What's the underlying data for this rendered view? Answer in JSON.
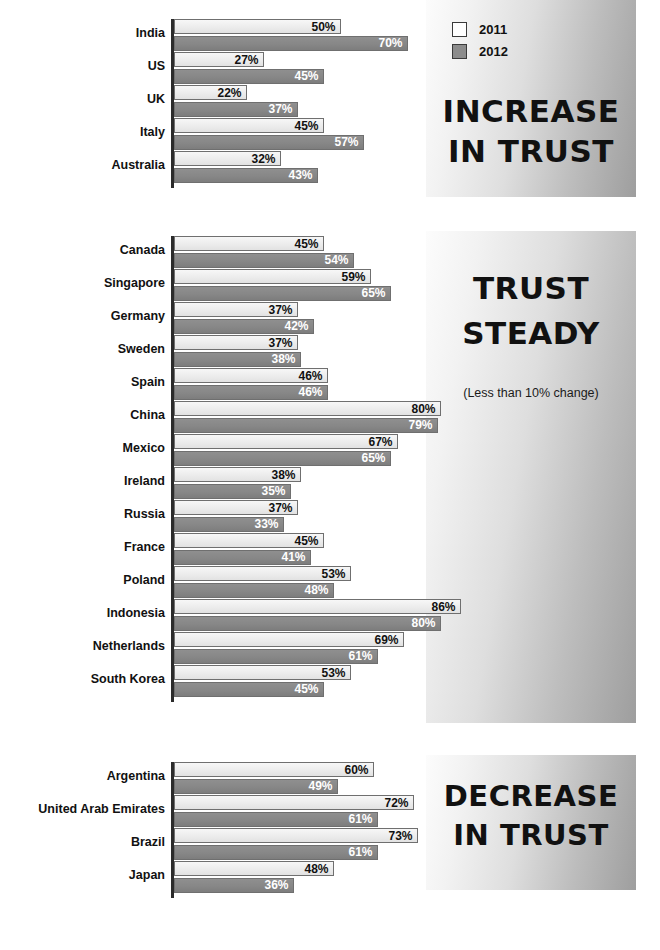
{
  "legend": {
    "items": [
      {
        "label": "2011",
        "swatch": "white-square-icon",
        "color": "#ffffff"
      },
      {
        "label": "2012",
        "swatch": "gray-square-icon",
        "color": "#8c8c8c"
      }
    ]
  },
  "panels": [
    {
      "id": "increase",
      "title_lines": [
        "INCREASE",
        "IN TRUST"
      ],
      "subtitle": ""
    },
    {
      "id": "steady",
      "title_lines": [
        "TRUST",
        "STEADY"
      ],
      "subtitle": "(Less than 10% change)"
    },
    {
      "id": "decrease",
      "title_lines": [
        "DECREASE",
        "IN TRUST"
      ],
      "subtitle": ""
    }
  ],
  "chart_data": {
    "type": "bar",
    "title": "",
    "subtitle": "",
    "xlabel": "",
    "ylabel": "",
    "orientation": "horizontal",
    "grid": false,
    "legend_position": "top-right",
    "xlim": [
      0,
      100
    ],
    "value_suffix": "%",
    "series": [
      {
        "name": "2011",
        "color": "#ebebeb",
        "label_color": "#111111"
      },
      {
        "name": "2012",
        "color": "#878787",
        "label_color": "#ffffff"
      }
    ],
    "groups": [
      {
        "name": "INCREASE IN TRUST",
        "categories": [
          "India",
          "US",
          "UK",
          "Italy",
          "Australia"
        ],
        "series": [
          {
            "name": "2011",
            "values": [
              50,
              27,
              22,
              45,
              32
            ]
          },
          {
            "name": "2012",
            "values": [
              70,
              45,
              37,
              57,
              43
            ]
          }
        ]
      },
      {
        "name": "TRUST STEADY",
        "note": "(Less than 10% change)",
        "categories": [
          "Canada",
          "Singapore",
          "Germany",
          "Sweden",
          "Spain",
          "China",
          "Mexico",
          "Ireland",
          "Russia",
          "France",
          "Poland",
          "Indonesia",
          "Netherlands",
          "South Korea"
        ],
        "series": [
          {
            "name": "2011",
            "values": [
              45,
              59,
              37,
              37,
              46,
              80,
              67,
              38,
              37,
              45,
              53,
              86,
              69,
              53
            ]
          },
          {
            "name": "2012",
            "values": [
              54,
              65,
              42,
              38,
              46,
              79,
              65,
              35,
              33,
              41,
              48,
              80,
              61,
              45
            ]
          }
        ]
      },
      {
        "name": "DECREASE IN TRUST",
        "categories": [
          "Argentina",
          "United Arab Emirates",
          "Brazil",
          "Japan"
        ],
        "series": [
          {
            "name": "2011",
            "values": [
              60,
              72,
              73,
              48
            ]
          },
          {
            "name": "2012",
            "values": [
              49,
              61,
              61,
              36
            ]
          }
        ]
      }
    ],
    "labels": {
      "India": {
        "2011": "50%",
        "2012": "70%"
      },
      "US": {
        "2011": "27%",
        "2012": "45%"
      },
      "UK": {
        "2011": "22%",
        "2012": "37%"
      },
      "Italy": {
        "2011": "45%",
        "2012": "57%"
      },
      "Australia": {
        "2011": "32%",
        "2012": "43%"
      },
      "Canada": {
        "2011": "45%",
        "2012": "54%"
      },
      "Singapore": {
        "2011": "59%",
        "2012": "65%"
      },
      "Germany": {
        "2011": "37%",
        "2012": "42%"
      },
      "Sweden": {
        "2011": "37%",
        "2012": "38%"
      },
      "Spain": {
        "2011": "46%",
        "2012": "46%"
      },
      "China": {
        "2011": "80%",
        "2012": "79%"
      },
      "Mexico": {
        "2011": "67%",
        "2012": "65%"
      },
      "Ireland": {
        "2011": "38%",
        "2012": "35%"
      },
      "Russia": {
        "2011": "37%",
        "2012": "33%"
      },
      "France": {
        "2011": "45%",
        "2012": "41%"
      },
      "Poland": {
        "2011": "53%",
        "2012": "48%"
      },
      "Indonesia": {
        "2011": "86%",
        "2012": "80%"
      },
      "Netherlands": {
        "2011": "69%",
        "2012": "61%"
      },
      "South Korea": {
        "2011": "53%",
        "2012": "45%"
      },
      "Argentina": {
        "2011": "60%",
        "2012": "49%"
      },
      "United Arab Emirates": {
        "2011": "72%",
        "2012": "61%"
      },
      "Brazil": {
        "2011": "73%",
        "2012": "61%"
      },
      "Japan": {
        "2011": "48%",
        "2012": "36%"
      }
    }
  },
  "layout": {
    "px_per_percent": 3.34,
    "group_tops": [
      19,
      236,
      762
    ],
    "row_height": 33
  }
}
